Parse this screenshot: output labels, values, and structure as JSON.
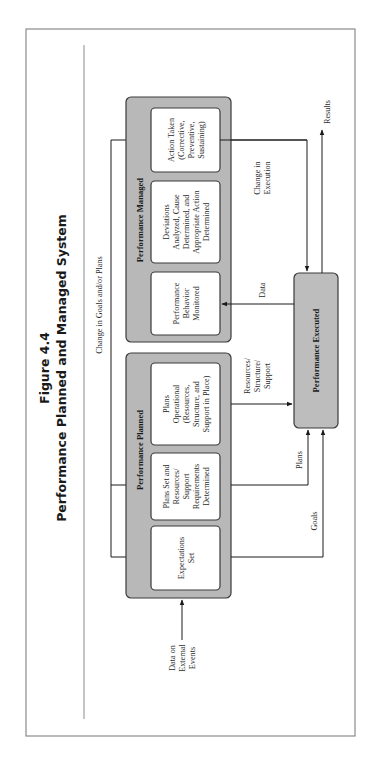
{
  "figure": {
    "number": "Figure 4.4",
    "title": "Performance Planned and Managed System"
  },
  "groups": {
    "managed": {
      "label": "Performance Managed",
      "steps": [
        {
          "lines": [
            "Action Taken",
            "(Corrective,",
            "Preventive,",
            "Sustaining)"
          ]
        },
        {
          "lines": [
            "Deviations",
            "Analyzed, Cause",
            "Determined, and",
            "Appropriate Action",
            "Determined"
          ]
        },
        {
          "lines": [
            "Performance",
            "Behavior",
            "Monitored"
          ]
        }
      ]
    },
    "planned": {
      "label": "Performance Planned",
      "steps": [
        {
          "lines": [
            "Plans",
            "Operational",
            "(Resources,",
            "Structure, and",
            "Support in Place)"
          ]
        },
        {
          "lines": [
            "Plans Set and",
            "Resources/",
            "Support",
            "Requirements",
            "Determined"
          ]
        },
        {
          "lines": [
            "Expectations",
            "Set"
          ]
        }
      ]
    },
    "executed": {
      "label": "Performance Executed"
    }
  },
  "flows": {
    "feedback": "Change in Goals and/or Plans",
    "change_execution": [
      "Change in",
      "Execution"
    ],
    "results": "Results",
    "data": "Data",
    "resources": [
      "Resources/",
      "Structure/",
      "Support"
    ],
    "plans": "Plans",
    "goals": "Goals",
    "external": [
      "Data on",
      "External",
      "Events"
    ]
  },
  "colors": {
    "group_fill": "#b8b8b8",
    "box_fill": "#ffffff",
    "line": "#1a1a1a",
    "frame": "#8a8a8a"
  }
}
